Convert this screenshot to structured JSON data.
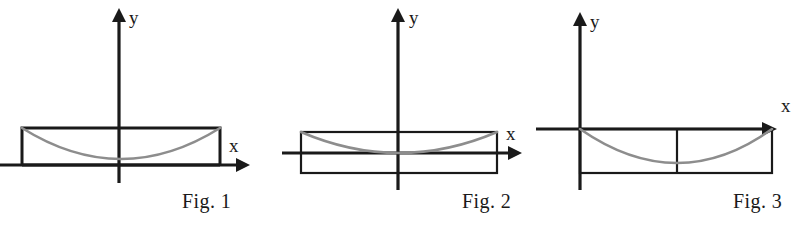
{
  "document": {
    "kind": "figure-strip",
    "background_color": "#ffffff",
    "width": 794,
    "height": 228
  },
  "style": {
    "axis_color": "#1a1a1a",
    "rectangle_color": "#1a1a1a",
    "curve_color": "#8d8d8d"
  },
  "figures": [
    {
      "id": "fig-1",
      "caption": "Fig. 1",
      "x_axis_label": "x",
      "y_axis_label": "y",
      "description": "Rectangle sits entirely above the x-axis; the concave-up curve runs from the top-left corner down to a minimum above the origin and back up to the top-right corner.",
      "origin": {
        "x": 119,
        "y": 165
      },
      "x_axis": {
        "start_x": 0,
        "end_x": 243,
        "y": 165,
        "arrow": "right"
      },
      "y_axis": {
        "x": 119,
        "start_y": 183,
        "end_y": 10,
        "arrow": "up"
      },
      "rectangle": {
        "left": 22,
        "right": 220,
        "top": 128,
        "bottom": 165
      },
      "divider_x": null,
      "curve": {
        "left_x": 22,
        "left_y": 128,
        "right_x": 220,
        "right_y": 128,
        "vertex_x": 121,
        "vertex_y": 159
      },
      "x_label_pos": {
        "x": 229,
        "y": 152
      },
      "y_label_pos": {
        "x": 129,
        "y": 24
      }
    },
    {
      "id": "fig-2",
      "caption": "Fig. 2",
      "x_axis_label": "x",
      "y_axis_label": "y",
      "description": "Rectangle straddles the x-axis; the concave-up curve runs from the top-left corner through the origin, tangent to the x-axis, and up to the top-right corner.",
      "origin": {
        "x": 398,
        "y": 153
      },
      "x_axis": {
        "start_x": 282,
        "end_x": 520,
        "y": 153,
        "arrow": "right"
      },
      "y_axis": {
        "x": 398,
        "start_y": 190,
        "end_y": 10,
        "arrow": "up"
      },
      "rectangle": {
        "left": 301,
        "right": 497,
        "top": 132,
        "bottom": 173
      },
      "divider_x": null,
      "curve": {
        "left_x": 301,
        "left_y": 132,
        "right_x": 497,
        "right_y": 132,
        "vertex_x": 399,
        "vertex_y": 153
      },
      "x_label_pos": {
        "x": 506,
        "y": 140
      },
      "y_label_pos": {
        "x": 409,
        "y": 24
      }
    },
    {
      "id": "fig-3",
      "caption": "Fig. 3",
      "x_axis_label": "x",
      "y_axis_label": "y",
      "description": "Rectangle lies entirely below the x-axis with its left edge on the y-axis and a vertical divider at its midpoint; the concave-up curve dips from the origin to a minimum and returns to the x-axis at the right edge.",
      "origin": {
        "x": 580,
        "y": 129
      },
      "x_axis": {
        "start_x": 536,
        "end_x": 775,
        "y": 129,
        "arrow": "right"
      },
      "y_axis": {
        "x": 580,
        "start_y": 190,
        "end_y": 14,
        "arrow": "up"
      },
      "rectangle": {
        "left": 580,
        "right": 772,
        "top": 129,
        "bottom": 173
      },
      "divider_x": 677,
      "curve": {
        "left_x": 580,
        "left_y": 129,
        "right_x": 772,
        "right_y": 129,
        "vertex_x": 678,
        "vertex_y": 163
      },
      "x_label_pos": {
        "x": 781,
        "y": 112
      },
      "y_label_pos": {
        "x": 590,
        "y": 28
      }
    }
  ]
}
